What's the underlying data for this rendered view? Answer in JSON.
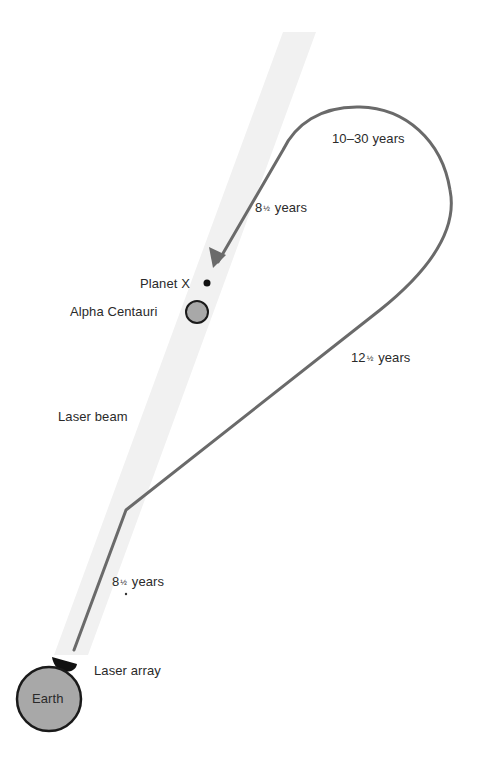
{
  "diagram": {
    "colors": {
      "background": "#ffffff",
      "beam": "#f1f1f1",
      "path": "#6a6a6a",
      "body_fill": "#a8a8a8",
      "body_stroke": "#1a1a1a",
      "laser_array": "#111111",
      "text": "#2a2a2a"
    },
    "bodies": {
      "earth": {
        "label": "Earth"
      },
      "alpha_centauri": {
        "label": "Alpha Centauri"
      },
      "planet_x": {
        "label": "Planet X"
      }
    },
    "components": {
      "laser_beam": {
        "label": "Laser beam"
      },
      "laser_array": {
        "label": "Laser array"
      }
    },
    "segments": [
      {
        "id": "leg1",
        "whole": "8",
        "fraction": "½",
        "unit": "years"
      },
      {
        "id": "leg2",
        "whole": "12",
        "fraction": "½",
        "unit": "years"
      },
      {
        "id": "loop",
        "whole": "10–30",
        "fraction": "",
        "unit": "years"
      },
      {
        "id": "leg3",
        "whole": "8",
        "fraction": "½",
        "unit": "years"
      }
    ]
  }
}
